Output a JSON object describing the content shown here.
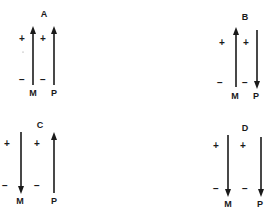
{
  "figure": {
    "panels": [
      {
        "id": "A",
        "title": "A",
        "arrows": [
          {
            "name": "M",
            "label": "M",
            "direction": "up"
          },
          {
            "name": "P",
            "label": "P",
            "direction": "up"
          }
        ],
        "signs": {
          "plus": "+",
          "minus": "−"
        }
      },
      {
        "id": "B",
        "title": "B",
        "arrows": [
          {
            "name": "M",
            "label": "M",
            "direction": "up"
          },
          {
            "name": "P",
            "label": "P",
            "direction": "down"
          }
        ],
        "signs": {
          "plus": "+",
          "minus": "−"
        }
      },
      {
        "id": "C",
        "title": "C",
        "arrows": [
          {
            "name": "M",
            "label": "M",
            "direction": "down"
          },
          {
            "name": "P",
            "label": "P",
            "direction": "up"
          }
        ],
        "signs": {
          "plus": "+",
          "minus": "−"
        }
      },
      {
        "id": "D",
        "title": "D",
        "arrows": [
          {
            "name": "M",
            "label": "M",
            "direction": "down"
          },
          {
            "name": "P",
            "label": "P",
            "direction": "down"
          }
        ],
        "signs": {
          "plus": "+",
          "minus": "−"
        }
      }
    ],
    "colors": {
      "ink": "#1a1a1a",
      "background": "#ffffff"
    }
  }
}
